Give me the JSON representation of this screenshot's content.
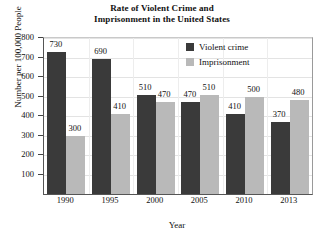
{
  "chart_data": {
    "type": "bar",
    "title": "Rate of Violent Crime and Imprisonment in the United States",
    "title_lines": [
      "Rate of Violent Crime and",
      "Imprisonment in the United States"
    ],
    "xlabel": "Year",
    "ylabel": "Number per 100,000 People",
    "categories": [
      "1990",
      "1995",
      "2000",
      "2005",
      "2010",
      "2013"
    ],
    "series": [
      {
        "name": "Violent crime",
        "color": "#3a3a3a",
        "values": [
          730,
          690,
          510,
          470,
          410,
          370
        ],
        "labels": [
          "730",
          "690",
          "510",
          "470",
          "410",
          "370"
        ]
      },
      {
        "name": "Imprisonment",
        "color": "#b9b9b9",
        "values": [
          300,
          410,
          470,
          510,
          500,
          480
        ],
        "labels": [
          "300",
          "410",
          "470",
          "510",
          "500",
          "480"
        ]
      }
    ],
    "ylim": [
      0,
      800
    ],
    "ytick_values": [
      100,
      200,
      300,
      400,
      500,
      600,
      700,
      800
    ],
    "ytick_labels": [
      "100",
      "200",
      "300",
      "400",
      "500",
      "600",
      "700",
      "800"
    ],
    "grid": true,
    "legend_position": "top-right",
    "legend": [
      {
        "label": "Violent crime",
        "color": "#3a3a3a"
      },
      {
        "label": "Imprisonment",
        "color": "#b9b9b9"
      }
    ]
  }
}
